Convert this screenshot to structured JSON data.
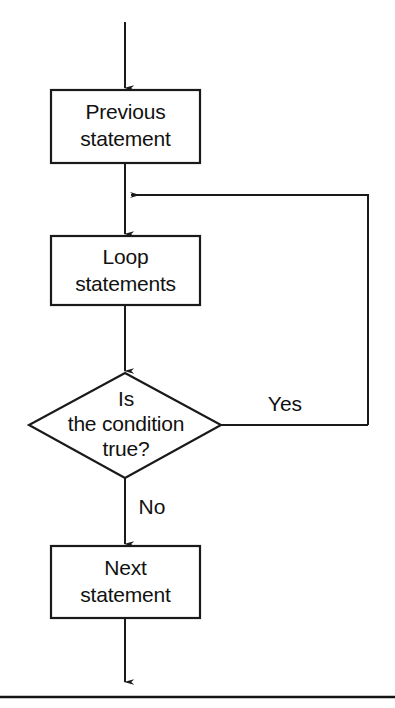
{
  "diagram": {
    "background_color": "#ffffff",
    "line_color": "#1a1a1a",
    "text_color": "#111111",
    "nodes": [
      {
        "id": "previous",
        "shape": "rectangle",
        "lines": [
          "Previous",
          "statement"
        ],
        "line1": "Previous",
        "line2": "statement",
        "x": 51,
        "y": 90,
        "width": 149,
        "height": 73
      },
      {
        "id": "loop",
        "shape": "rectangle",
        "lines": [
          "Loop",
          "statements"
        ],
        "line1": "Loop",
        "line2": "statements",
        "x": 51,
        "y": 236,
        "width": 149,
        "height": 69
      },
      {
        "id": "condition",
        "shape": "diamond",
        "lines": [
          "Is",
          "the condition",
          "true?"
        ],
        "line1": "Is",
        "line2": "the condition",
        "line3": "true?",
        "cx": 125,
        "cy": 425,
        "half_width": 96,
        "half_height": 52
      },
      {
        "id": "next",
        "shape": "rectangle",
        "lines": [
          "Next",
          "statement"
        ],
        "line1": "Next",
        "line2": "statement",
        "x": 51,
        "y": 546,
        "width": 149,
        "height": 72
      }
    ],
    "edges": [
      {
        "id": "entry",
        "from": "top-of-page",
        "to": "previous",
        "label": "",
        "arrow": true
      },
      {
        "id": "previous-to-loop",
        "from": "previous",
        "to": "loop",
        "label": "",
        "arrow": true
      },
      {
        "id": "loop-to-condition",
        "from": "loop",
        "to": "condition",
        "label": "",
        "arrow": true
      },
      {
        "id": "condition-yes-back",
        "from": "condition",
        "to": "loop-entry",
        "label": "Yes",
        "arrow": true
      },
      {
        "id": "condition-no",
        "from": "condition",
        "to": "next",
        "label": "No",
        "arrow": true
      },
      {
        "id": "exit",
        "from": "next",
        "to": "bottom-of-page",
        "label": "",
        "arrow": true
      }
    ],
    "labels": {
      "yes": "Yes",
      "no": "No"
    }
  }
}
